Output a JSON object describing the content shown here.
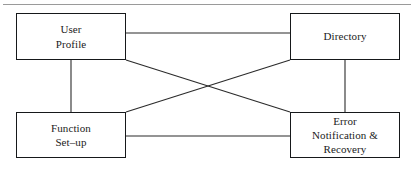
{
  "figure": {
    "background_color": "#ffffff",
    "rule_color": "#9a9a9a",
    "line_color": "#2b2b2b",
    "box_border_color": "#16181a",
    "text_color": "#1b1b1b"
  },
  "nodes": [
    {
      "id": "user-profile",
      "label": "User\nProfile"
    },
    {
      "id": "directory",
      "label": "Directory"
    },
    {
      "id": "function-setup",
      "label": "Function\nSet–up"
    },
    {
      "id": "error-recovery",
      "label": "Error\nNotification &\nRecovery"
    }
  ],
  "edges": [
    {
      "id": "user-profile--directory",
      "type": "horizontal",
      "x1": 126,
      "y1": 33,
      "x2": 290,
      "y2": 33
    },
    {
      "id": "function-setup--error-recovery",
      "type": "horizontal",
      "x1": 126,
      "y1": 136,
      "x2": 290,
      "y2": 136
    },
    {
      "id": "user-profile--function-setup",
      "type": "vertical",
      "x1": 71,
      "y1": 60,
      "x2": 71,
      "y2": 112
    },
    {
      "id": "directory--error-recovery",
      "type": "vertical",
      "x1": 345,
      "y1": 60,
      "x2": 345,
      "y2": 112
    },
    {
      "id": "user-profile--error-recovery",
      "type": "diagonal",
      "x1": 126,
      "y1": 60,
      "x2": 290,
      "y2": 112
    },
    {
      "id": "function-setup--directory",
      "type": "diagonal",
      "x1": 126,
      "y1": 112,
      "x2": 290,
      "y2": 60
    }
  ]
}
